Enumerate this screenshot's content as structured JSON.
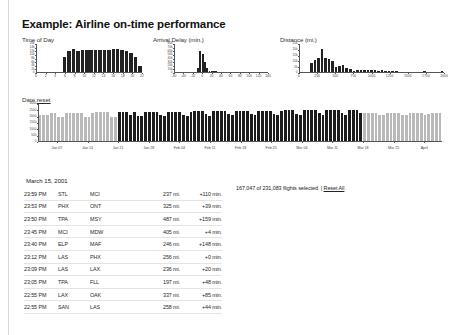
{
  "page": {
    "title": "Example: Airline on-time performance"
  },
  "status": {
    "text": "167,047 of 231,083 flights selected. |",
    "reset_all_label": "Reset All"
  },
  "date_section": {
    "label": "Date",
    "reset_label": "reset",
    "ticks": [
      "Jan 07",
      "Jan 14",
      "Jan 21",
      "Jan 28",
      "Feb 04",
      "Feb 11",
      "Feb 18",
      "Feb 25",
      "Mar 04",
      "Mar 11",
      "Mar 18",
      "Mar 25",
      "April"
    ]
  },
  "table": {
    "date_header": "March 15, 2001",
    "rows": [
      {
        "time": "23:59 PM",
        "origin": "STL",
        "dest": "MCI",
        "distance": "237 mi.",
        "delay": "+110 min."
      },
      {
        "time": "23:53 PM",
        "origin": "PHX",
        "dest": "ONT",
        "distance": "325 mi.",
        "delay": "+39 min."
      },
      {
        "time": "23:50 PM",
        "origin": "TPA",
        "dest": "MSY",
        "distance": "487 mi.",
        "delay": "+159 min."
      },
      {
        "time": "23:45 PM",
        "origin": "MCI",
        "dest": "MDW",
        "distance": "405 mi.",
        "delay": "+4 min."
      },
      {
        "time": "23:40 PM",
        "origin": "ELP",
        "dest": "MAF",
        "distance": "246 mi.",
        "delay": "+148 min."
      },
      {
        "time": "23:12 PM",
        "origin": "LAS",
        "dest": "PHX",
        "distance": "256 mi.",
        "delay": "+0 min."
      },
      {
        "time": "23:09 PM",
        "origin": "LAS",
        "dest": "LAX",
        "distance": "236 mi.",
        "delay": "+20 min."
      },
      {
        "time": "23:05 PM",
        "origin": "TPA",
        "dest": "FLL",
        "distance": "197 mi.",
        "delay": "+48 min."
      },
      {
        "time": "22:55 PM",
        "origin": "LAX",
        "dest": "OAK",
        "distance": "337 mi.",
        "delay": "+85 min."
      },
      {
        "time": "22:55 PM",
        "origin": "SAN",
        "dest": "LAS",
        "distance": "258 mi.",
        "delay": "+44 min."
      }
    ]
  },
  "chart_data": [
    {
      "type": "bar",
      "title": "Time of Day",
      "xlabel": "",
      "ylabel": "",
      "xticks": [
        "0",
        "2",
        "4",
        "6",
        "8",
        "10",
        "12",
        "14",
        "16",
        "18",
        "20",
        "22"
      ],
      "yticks": [
        "16k",
        "14k",
        "12k",
        "10k",
        "8k",
        "6k",
        "4k",
        "2k",
        "0"
      ],
      "ylim": [
        0,
        16000
      ],
      "categories": [
        "0",
        "1",
        "2",
        "3",
        "4",
        "5",
        "6",
        "7",
        "8",
        "9",
        "10",
        "11",
        "12",
        "13",
        "14",
        "15",
        "16",
        "17",
        "18",
        "19",
        "20",
        "21",
        "22",
        "23"
      ],
      "values": [
        0,
        0,
        0,
        0,
        0,
        0,
        9000,
        12000,
        13400,
        12200,
        12500,
        12500,
        12600,
        12500,
        12500,
        12500,
        12700,
        13000,
        13500,
        12900,
        12000,
        10800,
        9000,
        3600
      ],
      "grid": false,
      "legend": "none"
    },
    {
      "type": "bar",
      "title": "Arrival Delay (min.)",
      "xlabel": "",
      "ylabel": "",
      "xticks": [
        "-60",
        "-40",
        "-20",
        "0",
        "20",
        "40",
        "60",
        "80",
        "100",
        "120",
        "140"
      ],
      "yticks": [
        "80k",
        "70k",
        "60k",
        "50k",
        "40k",
        "30k",
        "20k",
        "10k",
        "0"
      ],
      "ylim": [
        0,
        80000
      ],
      "x": [
        -60,
        -55,
        -50,
        -45,
        -40,
        -35,
        -30,
        -25,
        -20,
        -15,
        -10,
        -5,
        0,
        5,
        10,
        15,
        20,
        25,
        30,
        35,
        40,
        45,
        50,
        55,
        60,
        65,
        70,
        75,
        80,
        85,
        90,
        95,
        100,
        105,
        110,
        115,
        120,
        125,
        130,
        135,
        140
      ],
      "values": [
        0,
        0,
        0,
        0,
        0,
        0,
        0,
        0,
        1000,
        3000,
        14000,
        62000,
        52000,
        30000,
        13000,
        5000,
        5000,
        5000,
        4500,
        4000,
        3500,
        3000,
        2800,
        2500,
        2200,
        2000,
        1800,
        1600,
        1500,
        1300,
        1200,
        1100,
        1000,
        900,
        800,
        700,
        600,
        500,
        400,
        300,
        200
      ],
      "grid": false,
      "legend": "none"
    },
    {
      "type": "bar",
      "title": "Distance (mi.)",
      "xlabel": "",
      "ylabel": "",
      "xticks": [
        "0",
        "250",
        "500",
        "750",
        "1000",
        "1250",
        "1500",
        "1750",
        "2000"
      ],
      "yticks": [
        "25k",
        "20k",
        "15k",
        "10k",
        "5k",
        "0"
      ],
      "ylim": [
        0,
        25000
      ],
      "x": [
        0,
        50,
        100,
        150,
        200,
        250,
        300,
        350,
        400,
        450,
        500,
        550,
        600,
        650,
        700,
        750,
        800,
        850,
        900,
        950,
        1000,
        1050,
        1100,
        1150,
        1200,
        1250,
        1300,
        1350,
        1400,
        1450,
        1500,
        1550,
        1600,
        1650,
        1700,
        1750,
        1800,
        1850,
        1900,
        1950,
        2000
      ],
      "values": [
        0,
        0,
        0,
        9000,
        11000,
        13000,
        21000,
        13000,
        12500,
        10000,
        5000,
        6000,
        6500,
        4500,
        3500,
        2000,
        3000,
        3000,
        3000,
        2500,
        3000,
        2500,
        2000,
        2500,
        2000,
        1500,
        1500,
        1800,
        1200,
        900,
        800,
        700,
        600,
        400,
        400,
        1500,
        300,
        200,
        200,
        200,
        1500
      ],
      "grid": false,
      "legend": "none"
    },
    {
      "type": "bar",
      "title": "Date",
      "xlabel": "",
      "ylabel": "",
      "yticks": [
        "3000",
        "2500",
        "2000",
        "1500",
        "1000",
        "500",
        "0"
      ],
      "ylim": [
        0,
        3000
      ],
      "selection_start_index": 21,
      "selection_end_index": 85,
      "values": [
        2150,
        2150,
        2150,
        2300,
        2330,
        1950,
        1960,
        2300,
        2330,
        2330,
        2330,
        2330,
        2000,
        1980,
        2330,
        2340,
        2340,
        2340,
        2340,
        2000,
        2010,
        2350,
        2360,
        2360,
        2130,
        2360,
        2030,
        2050,
        2370,
        2380,
        2380,
        2380,
        2150,
        2060,
        2390,
        2390,
        2390,
        2390,
        2160,
        2080,
        2400,
        2410,
        2410,
        2410,
        2180,
        2090,
        2420,
        2430,
        2430,
        2430,
        2200,
        2100,
        2440,
        2450,
        2450,
        2450,
        2220,
        2110,
        2460,
        2470,
        2470,
        2470,
        2240,
        2130,
        2480,
        2490,
        2490,
        2490,
        2250,
        2150,
        2500,
        2510,
        2510,
        2510,
        2270,
        2160,
        2520,
        2530,
        2530,
        2530,
        2290,
        2170,
        2540,
        2550,
        2550,
        2290,
        2300,
        2300,
        2300,
        2300,
        2150,
        2160,
        2310,
        2310,
        2310,
        2310,
        2160,
        2170,
        2320,
        2320,
        2320,
        2320,
        2170,
        2180,
        2330,
        2330,
        2330
      ],
      "grid": false,
      "legend": "none"
    }
  ]
}
